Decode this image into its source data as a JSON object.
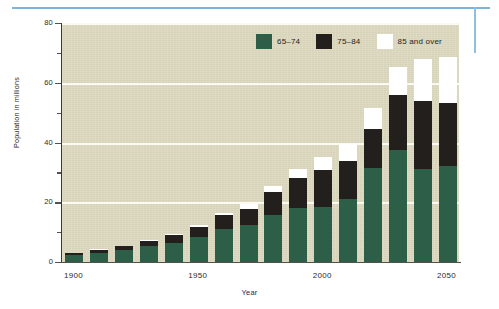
{
  "chart_data": {
    "type": "bar",
    "subtype": "stacked-vertical",
    "title": "",
    "xlabel": "Year",
    "ylabel": "Population in millions",
    "xlim": [
      1895,
      2055
    ],
    "ylim": [
      0,
      80
    ],
    "grid": "horizontal-major",
    "y_major_ticks": [
      0,
      20,
      40,
      60,
      80
    ],
    "y_minor_ticks": [
      10,
      30,
      50,
      70
    ],
    "y_tick_labels": [
      "0",
      "20",
      "40",
      "60",
      "80"
    ],
    "x_tick_labels": [
      "1900",
      "1950",
      "2000",
      "2050"
    ],
    "x_tick_values": [
      1900,
      1950,
      2000,
      2050
    ],
    "categories": [
      1900,
      1910,
      1920,
      1930,
      1940,
      1950,
      1960,
      1970,
      1980,
      1990,
      2000,
      2010,
      2020,
      2030,
      2040,
      2050
    ],
    "legend_position": "top-right",
    "series": [
      {
        "name": "65–74",
        "color": "#2d5e48",
        "values": [
          2.2,
          3.0,
          3.9,
          5.4,
          6.4,
          8.4,
          11.0,
          12.4,
          15.6,
          18.0,
          18.4,
          21.2,
          31.4,
          37.4,
          31.0,
          32.0
        ]
      },
      {
        "name": "75–84",
        "color": "#231f1d",
        "values": [
          0.8,
          1.0,
          1.3,
          1.8,
          2.6,
          3.3,
          4.6,
          5.5,
          7.7,
          10.1,
          12.4,
          12.6,
          13.2,
          18.4,
          22.8,
          21.2
        ]
      },
      {
        "name": "85 and over",
        "color": "#ffffff",
        "values": [
          0.1,
          0.2,
          0.2,
          0.3,
          0.4,
          0.6,
          0.9,
          1.4,
          2.3,
          3.0,
          4.2,
          5.7,
          6.8,
          9.6,
          14.3,
          15.4
        ]
      }
    ],
    "totals": [
      3.1,
      4.2,
      5.4,
      7.5,
      9.4,
      12.3,
      16.5,
      19.3,
      25.6,
      31.1,
      35.0,
      39.5,
      51.4,
      65.4,
      68.1,
      68.6
    ]
  },
  "legend": {
    "items": [
      {
        "label": "65–74",
        "color": "#2d5e48"
      },
      {
        "label": "75–84",
        "color": "#231f1d"
      },
      {
        "label": "85 and over",
        "color": "#ffffff"
      }
    ]
  },
  "axes": {
    "y_title": "Population in millions",
    "x_title": "Year"
  },
  "colors": {
    "plot_background": "#dedac1",
    "gridline": "#fbfaf2",
    "axis": "#52524a",
    "rule_blue": "#7fb4d8",
    "series_65_74": "#2d5e48",
    "series_75_84": "#231f1d",
    "series_85_over": "#ffffff"
  }
}
